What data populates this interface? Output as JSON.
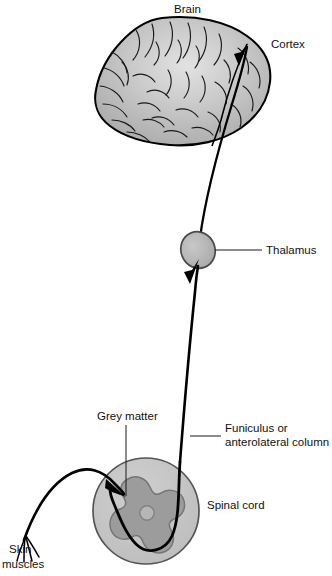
{
  "figure": {
    "width": 332,
    "height": 576,
    "background": "#ffffff"
  },
  "colors": {
    "brain_fill": "#b9b9b9",
    "brain_highlight": "#dedede",
    "brain_outline": "#000000",
    "thalamus_fill": "#b3b3b3",
    "thalamus_outline": "#4a4a4a",
    "cord_fill": "#c2c2c2",
    "cord_outline": "#555555",
    "grey_matter_fill": "#9c9c9c",
    "grey_matter_outline": "#6f6f6f",
    "tract_stroke": "#000000",
    "leader_stroke": "#1a1a1a",
    "label_text": "#111111"
  },
  "labels": {
    "brain": "Brain",
    "cortex": "Cortex",
    "thalamus": "Thalamus",
    "funiculus_line1": "Funiculus or",
    "funiculus_line2": "anterolateral column",
    "grey_matter": "Grey matter",
    "spinal_cord": "Spinal cord",
    "skin": "Skin",
    "muscles": "muscles"
  },
  "structures": [
    {
      "name": "brain",
      "label": "Brain",
      "shape": "cerebrum-lateral-view",
      "fill": "#b9b9b9",
      "bbox": [
        95,
        17,
        175,
        128
      ]
    },
    {
      "name": "thalamus",
      "label": "Thalamus",
      "shape": "ellipse",
      "fill": "#b3b3b3",
      "center": [
        198,
        250
      ],
      "radii": [
        17,
        18
      ]
    },
    {
      "name": "spinal-cord",
      "label": "Spinal cord",
      "shape": "circle",
      "fill": "#c2c2c2",
      "center": [
        146,
        511
      ],
      "radius": 53
    },
    {
      "name": "grey-matter",
      "label": "Grey matter",
      "shape": "butterfly",
      "fill": "#9c9c9c",
      "center": [
        147,
        512
      ]
    },
    {
      "name": "central-canal",
      "label": "",
      "shape": "circle",
      "fill": "#b4b4b4",
      "center": [
        147,
        512
      ],
      "radius": 7
    }
  ],
  "pathways": [
    {
      "name": "thalamocortical-tract",
      "from": "thalamus",
      "to": "cortex",
      "arrowhead": "cortex"
    },
    {
      "name": "spinothalamic-tract",
      "from": "spinal-cord",
      "to": "thalamus",
      "arrowhead": "thalamus"
    },
    {
      "name": "primary-afferent",
      "from": "skin-muscles",
      "to": "grey-matter",
      "arrowhead": "grey-matter"
    }
  ],
  "leaders": [
    {
      "name": "cortex-leader",
      "target": "cortex"
    },
    {
      "name": "thalamus-leader",
      "target": "thalamus"
    },
    {
      "name": "funiculus-leader",
      "target": "anterolateral-column"
    },
    {
      "name": "grey-matter-leader",
      "target": "grey-matter"
    }
  ]
}
